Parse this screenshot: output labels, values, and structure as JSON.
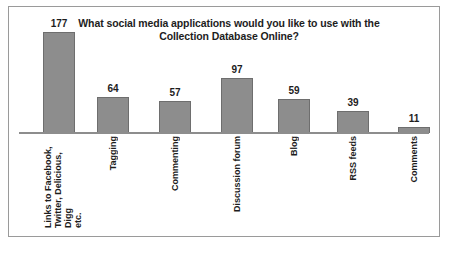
{
  "figure": {
    "frame_border_color": "#9a9a9a",
    "background_color": "#ffffff"
  },
  "chart_data": {
    "type": "bar",
    "title": "What social media applications would you like to use with the Collection Database Online?",
    "title_line_1": "What social media applications would you like to use with the",
    "title_line_2": "Collection Database Online?",
    "xlabel": "",
    "ylabel": "",
    "ylim": [
      0,
      190
    ],
    "grid": false,
    "legend": false,
    "bar_fill_color": "#8d8d8d",
    "bar_border_color": "#6e6e6e",
    "categories": [
      "Links to Facebook, Twitter, Delicious, Digg etc.",
      "Tagging",
      "Commenting",
      "Discussion forum",
      "Blog",
      "RSS feeds",
      "Comments"
    ],
    "values": [
      177,
      64,
      57,
      97,
      59,
      39,
      11
    ],
    "value_labels": [
      "177",
      "64",
      "57",
      "97",
      "59",
      "39",
      "11"
    ]
  }
}
